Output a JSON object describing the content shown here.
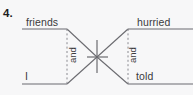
{
  "exercise": {
    "number": "4."
  },
  "diagram": {
    "type": "sentence-diagram",
    "style": "compound-subject-and-compound-predicate",
    "sentence_words": {
      "subject_upper": "friends",
      "subject_lower": "I",
      "predicate_upper": "hurried",
      "predicate_lower": "told"
    },
    "conjunctions": {
      "left": "and",
      "right": "and"
    },
    "colors": {
      "background": "#f7f7f8",
      "line": "#6b6b70",
      "text": "#3a3a3c",
      "number": "#1d1d1f"
    },
    "geometry": {
      "baseline_top_y": 29,
      "baseline_bottom_y": 84,
      "left_baseline_start_x": 22,
      "left_baseline_end_x": 67,
      "right_baseline_start_x": 128,
      "right_baseline_end_x": 193,
      "divider_x": 97,
      "divider_top_y": 40,
      "divider_bottom_y": 73,
      "crossbar_y": 57,
      "crossbar_x1": 87,
      "crossbar_x2": 108,
      "dotted_left_x": 67,
      "dotted_right_x": 128
    }
  }
}
